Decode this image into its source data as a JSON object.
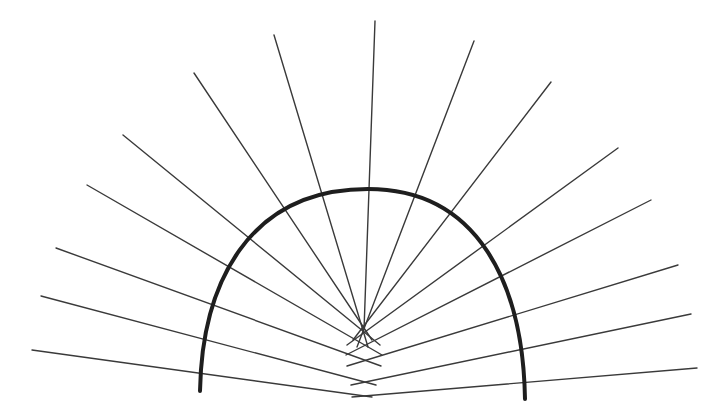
{
  "diagram": {
    "title": "",
    "colors": {
      "background": "#ffffff",
      "ray": "#3a3a3a",
      "arc": "#1e1e1e"
    },
    "arc": {
      "start": [
        200,
        391
      ],
      "peak": [
        368,
        189
      ],
      "end": [
        525,
        399
      ],
      "stroke_width": 4
    },
    "rays": [
      {
        "from": [
          32,
          350
        ],
        "to": [
          372,
          397
        ]
      },
      {
        "from": [
          41,
          296
        ],
        "to": [
          376,
          385
        ]
      },
      {
        "from": [
          56,
          248
        ],
        "to": [
          381,
          366
        ]
      },
      {
        "from": [
          87,
          185
        ],
        "to": [
          382,
          355
        ]
      },
      {
        "from": [
          123,
          135
        ],
        "to": [
          380,
          345
        ]
      },
      {
        "from": [
          194,
          73
        ],
        "to": [
          372,
          340
        ]
      },
      {
        "from": [
          274,
          35
        ],
        "to": [
          368,
          347
        ]
      },
      {
        "from": [
          375,
          21
        ],
        "to": [
          364,
          330
        ]
      },
      {
        "from": [
          474,
          41
        ],
        "to": [
          357,
          347
        ]
      },
      {
        "from": [
          551,
          82
        ],
        "to": [
          353,
          340
        ]
      },
      {
        "from": [
          618,
          148
        ],
        "to": [
          347,
          345
        ]
      },
      {
        "from": [
          651,
          200
        ],
        "to": [
          346,
          355
        ]
      },
      {
        "from": [
          678,
          265
        ],
        "to": [
          347,
          366
        ]
      },
      {
        "from": [
          691,
          314
        ],
        "to": [
          351,
          385
        ]
      },
      {
        "from": [
          697,
          368
        ],
        "to": [
          352,
          397
        ]
      }
    ]
  }
}
